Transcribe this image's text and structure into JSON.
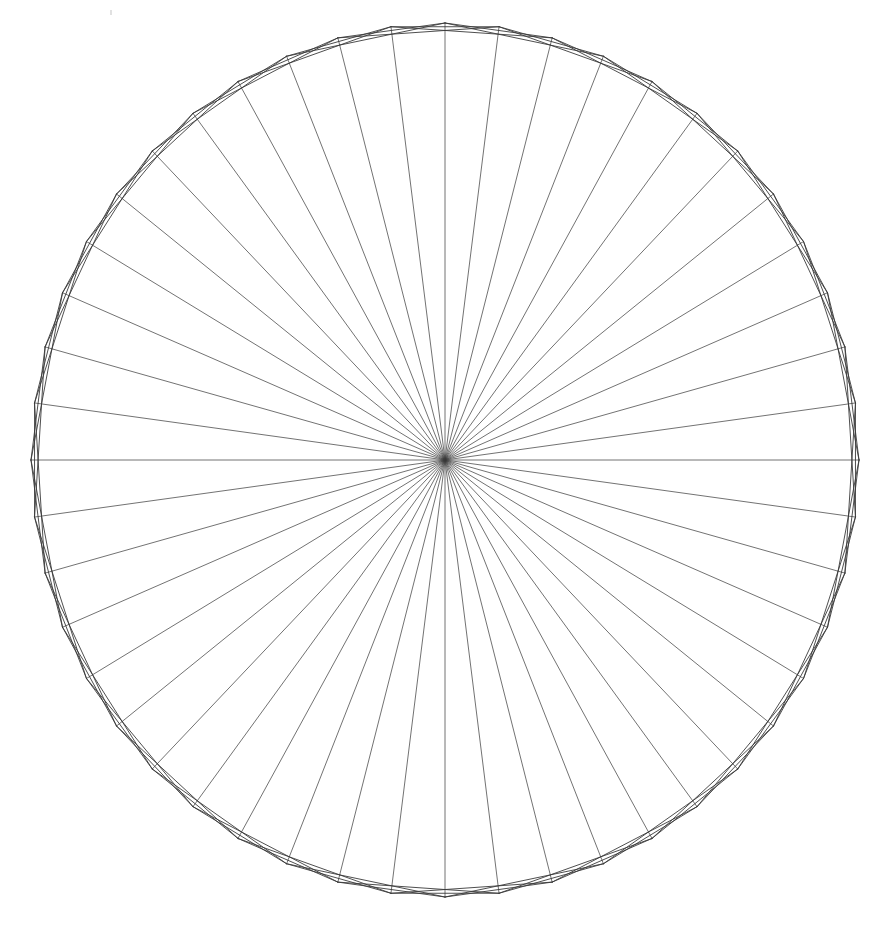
{
  "figure": {
    "title": "Radial star burst line figure",
    "background_color": "#ffffff",
    "stroke_color": "#3a3a3a",
    "stroke_width": 0.9,
    "canvas": {
      "width": 873,
      "height": 940
    }
  },
  "chart_data": {
    "type": "line",
    "title": "Radial star burst line figure",
    "subtitle": "",
    "xlabel": "",
    "ylabel": "",
    "grid": false,
    "legend_position": "none",
    "axis_visible": false,
    "tick_labels_visible": false,
    "center": {
      "x": 445,
      "y": 460
    },
    "radius_x": 414,
    "radius_y": 437,
    "n_points": 48,
    "angle_offset_deg": -90,
    "chord_steps": [
      2,
      3
    ],
    "draw_radial_spokes": true,
    "series": [
      {
        "name": "radial-spokes",
        "count": 48,
        "step": 0
      },
      {
        "name": "chords-step-2",
        "count": 48,
        "step": 2
      },
      {
        "name": "chords-step-3",
        "count": 48,
        "step": 3
      }
    ],
    "values": [
      414,
      414,
      414,
      414,
      414,
      414,
      414,
      414,
      414,
      414,
      414,
      414,
      414,
      414,
      414,
      414,
      414,
      414,
      414,
      414,
      414,
      414,
      414,
      414,
      414,
      414,
      414,
      414,
      414,
      414,
      414,
      414,
      414,
      414,
      414,
      414,
      414,
      414,
      414,
      414,
      414,
      414,
      414,
      414,
      414,
      414,
      414,
      414
    ],
    "categories": [
      "0",
      "1",
      "2",
      "3",
      "4",
      "5",
      "6",
      "7",
      "8",
      "9",
      "10",
      "11",
      "12",
      "13",
      "14",
      "15",
      "16",
      "17",
      "18",
      "19",
      "20",
      "21",
      "22",
      "23",
      "24",
      "25",
      "26",
      "27",
      "28",
      "29",
      "30",
      "31",
      "32",
      "33",
      "34",
      "35",
      "36",
      "37",
      "38",
      "39",
      "40",
      "41",
      "42",
      "43",
      "44",
      "45",
      "46",
      "47"
    ],
    "xlim": [
      31,
      859
    ],
    "ylim": [
      23,
      897
    ]
  },
  "artifacts": {
    "speck_top": {
      "x": 110,
      "y": 10,
      "label": "scanner-speck"
    }
  }
}
